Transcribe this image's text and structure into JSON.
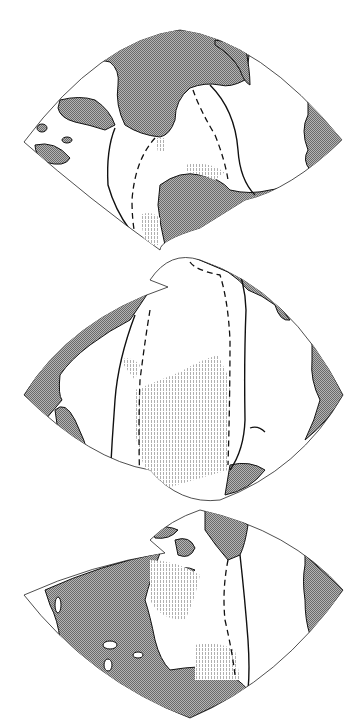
{
  "map": {
    "type": "interrupted-projection",
    "orientation": "vertical",
    "lobes": [
      {
        "id": "top",
        "label": ""
      },
      {
        "id": "middle",
        "label": ""
      },
      {
        "id": "bottom",
        "label": ""
      }
    ],
    "legend": {
      "land_fill": "dithered-gray",
      "shelf_fill": "light-vertical-stipple",
      "solid_line": "ridge/boundary line",
      "dashed_line": "secondary boundary line"
    },
    "colors": {
      "background": "#ffffff",
      "ocean": "#ffffff",
      "land": "#9c9c9c",
      "land_dark": "#6e6e6e",
      "stipple": "#b8b8b8",
      "outline": "#111111"
    }
  }
}
